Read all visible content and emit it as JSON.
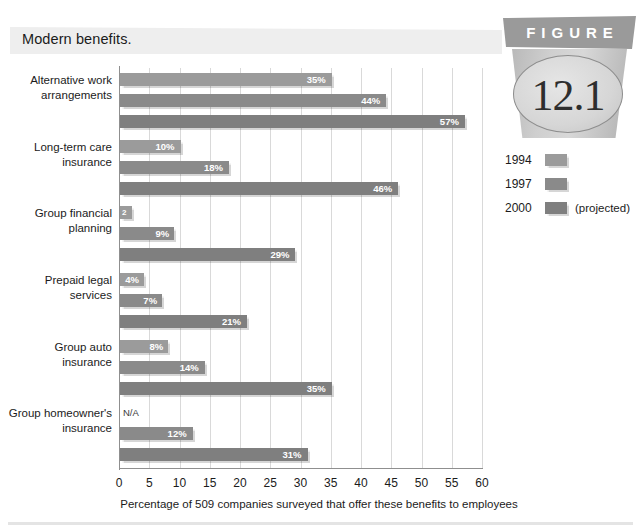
{
  "title": "Modern benefits.",
  "badge": {
    "banner_label": "FIGURE",
    "number": "12.1"
  },
  "legend": {
    "items": [
      {
        "label": "1994",
        "color": "#9b9b9b",
        "note": ""
      },
      {
        "label": "1997",
        "color": "#8a8a8a",
        "note": ""
      },
      {
        "label": "2000",
        "color": "#7f7f7f",
        "note": "(projected)"
      }
    ]
  },
  "chart_data": {
    "type": "bar",
    "orientation": "horizontal",
    "title": "Modern benefits.",
    "xlabel": "Percentage of 509 companies surveyed that offer these benefits to employees",
    "ylabel": "",
    "xlim": [
      0,
      60
    ],
    "xticks": [
      0,
      5,
      10,
      15,
      20,
      25,
      30,
      35,
      40,
      45,
      50,
      55,
      60
    ],
    "xtick_labels": [
      "0",
      "5",
      "10",
      "15",
      "20",
      "25",
      "30",
      "35",
      "40",
      "45",
      "50",
      "55",
      "60"
    ],
    "grid": "vertical",
    "legend_position": "right",
    "categories": [
      "Alternative work\narrangements",
      "Long-term care\ninsurance",
      "Group financial\nplanning",
      "Prepaid legal\nservices",
      "Group auto\ninsurance",
      "Group homeowner's\ninsurance"
    ],
    "series": [
      {
        "name": "1994",
        "color": "#9b9b9b",
        "values": [
          35,
          10,
          2,
          4,
          8,
          null
        ],
        "labels": [
          "35%",
          "10%",
          "2",
          "4%",
          "8%",
          "N/A"
        ]
      },
      {
        "name": "1997",
        "color": "#8a8a8a",
        "values": [
          44,
          18,
          9,
          7,
          14,
          12
        ],
        "labels": [
          "44%",
          "18%",
          "9%",
          "7%",
          "14%",
          "12%"
        ]
      },
      {
        "name": "2000",
        "color": "#7f7f7f",
        "values": [
          57,
          46,
          29,
          21,
          35,
          31
        ],
        "labels": [
          "57%",
          "46%",
          "29%",
          "21%",
          "35%",
          "31%"
        ]
      }
    ]
  }
}
